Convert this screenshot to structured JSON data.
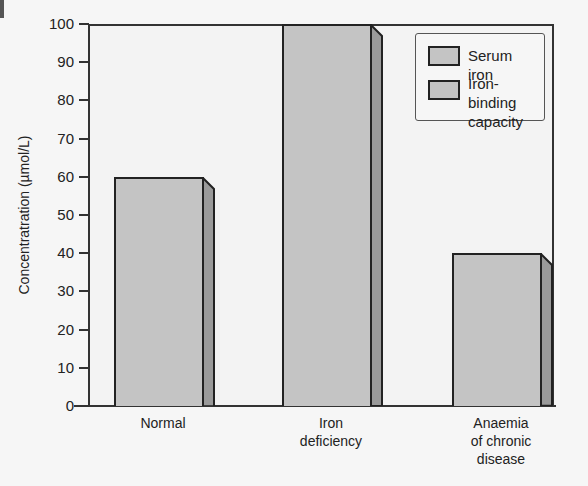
{
  "chart_data": {
    "type": "bar",
    "title": "",
    "xlabel": "",
    "ylabel": "Concentratration (µmol/L)",
    "ylim": [
      0,
      100
    ],
    "yticks": [
      0,
      10,
      20,
      30,
      40,
      50,
      60,
      70,
      80,
      90,
      100
    ],
    "grid": false,
    "legend_position": "top-right",
    "categories": [
      "Normal",
      "Iron deficiency",
      "Anaemia of chronic disease"
    ],
    "category_label_lines": [
      [
        "Normal"
      ],
      [
        "Iron",
        "deficiency"
      ],
      [
        "Anaemia",
        "of chronic",
        "disease"
      ]
    ],
    "series": [
      {
        "name": "Serum iron",
        "values": [
          60,
          100,
          40
        ],
        "color": "#c4c4c4"
      }
    ],
    "legend": [
      "Serum iron",
      "Iron-binding capacity"
    ],
    "legend_lines": [
      [
        "Serum iron"
      ],
      [
        "Iron-binding",
        "capacity"
      ]
    ],
    "style": "3d-bar"
  },
  "colors": {
    "bar_front": "#c4c4c4",
    "bar_side": "#9a9a9a",
    "plot_bg": "#f3f3f3",
    "axis": "#333333"
  }
}
